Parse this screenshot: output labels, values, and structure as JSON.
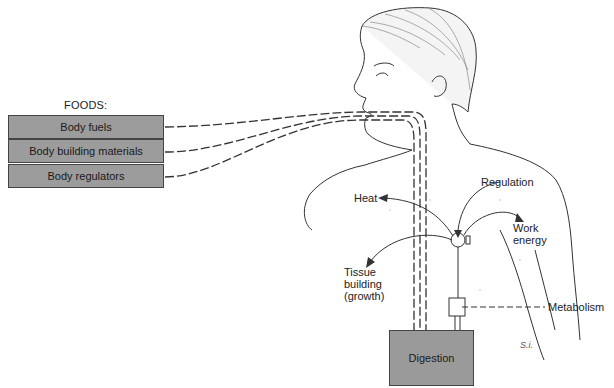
{
  "foods": {
    "title": "FOODS:",
    "items": [
      {
        "label": "Body fuels"
      },
      {
        "label": "Body building materials"
      },
      {
        "label": "Body regulators"
      }
    ]
  },
  "labels": {
    "heat": "Heat",
    "regulation": "Regulation",
    "work_energy_1": "Work",
    "work_energy_2": "energy",
    "tissue_1": "Tissue",
    "tissue_2": "building",
    "tissue_3": "(growth)",
    "metabolism": "Metabolism",
    "digestion": "Digestion",
    "signature": "S.i."
  },
  "colors": {
    "box_fill": "#9c9c9c",
    "line": "#333333"
  }
}
